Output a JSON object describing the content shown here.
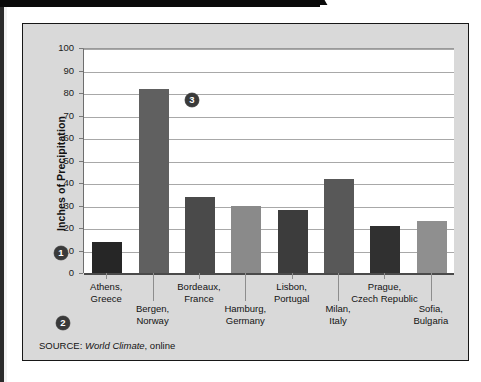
{
  "chart_data": {
    "type": "bar",
    "title": "",
    "xlabel": "",
    "ylabel": "Inches of Precipitation",
    "ylim": [
      0,
      100
    ],
    "ytick_step": 10,
    "yticks": [
      "100",
      "90",
      "80",
      "70",
      "60",
      "50",
      "40",
      "30",
      "20",
      "10",
      "0"
    ],
    "grid": true,
    "legend": "none",
    "categories": [
      "Athens,\nGreece",
      "Bergen,\nNorway",
      "Bordeaux,\nFrance",
      "Hamburg,\nGermany",
      "Lisbon,\nPortugal",
      "Milan,\nItaly",
      "Prague,\nCzech Republic",
      "Sofia,\nBulgaria"
    ],
    "values": [
      14,
      82,
      34,
      30,
      28,
      42,
      21,
      23
    ],
    "bars": [
      {
        "city": "Athens,",
        "country": "Greece",
        "value": 14,
        "color": "#262626",
        "row": "top"
      },
      {
        "city": "Bergen,",
        "country": "Norway",
        "value": 82,
        "color": "#606060",
        "row": "bottom"
      },
      {
        "city": "Bordeaux,",
        "country": "France",
        "value": 34,
        "color": "#4a4a4a",
        "row": "top"
      },
      {
        "city": "Hamburg,",
        "country": "Germany",
        "value": 30,
        "color": "#8a8a8a",
        "row": "bottom"
      },
      {
        "city": "Lisbon,",
        "country": "Portugal",
        "value": 28,
        "color": "#3c3c3c",
        "row": "top"
      },
      {
        "city": "Milan,",
        "country": "Italy",
        "value": 42,
        "color": "#585858",
        "row": "bottom"
      },
      {
        "city": "Prague,",
        "country": "Czech Republic",
        "value": 21,
        "color": "#303030",
        "row": "top"
      },
      {
        "city": "Sofia,",
        "country": "Bulgaria",
        "value": 23,
        "color": "#8f8f8f",
        "row": "bottom"
      }
    ]
  },
  "axis": {
    "y_title": "Inches of Precipitation"
  },
  "callouts": [
    {
      "id": "1",
      "label": "1"
    },
    {
      "id": "2",
      "label": "2"
    },
    {
      "id": "3",
      "label": "3"
    }
  ],
  "source": {
    "prefix": "SOURCE: ",
    "title": "World Climate",
    "suffix": ", online"
  },
  "colors": {
    "panel_background": "#d9d9d9",
    "plot_background": "#ffffff",
    "frame_border": "#171717",
    "gridline": "#a8a8a8",
    "axis": "#4a4a4a",
    "text": "#131313",
    "callout_fill": "#3a3a3a"
  }
}
